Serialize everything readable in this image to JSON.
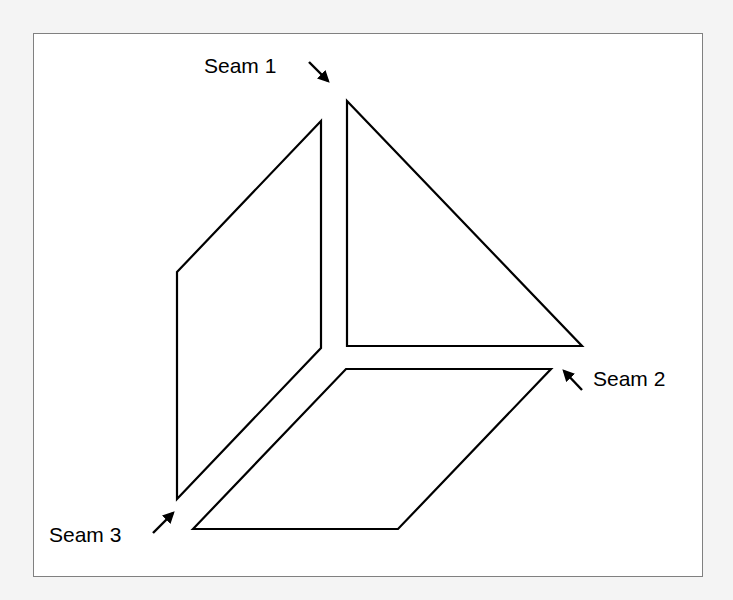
{
  "diagram": {
    "colors": {
      "background": "#f4f4f4",
      "frame_fill": "#ffffff",
      "frame_stroke": "#808080",
      "lines": "#000000"
    },
    "panels": [
      {
        "name": "left-panel",
        "points": "177,272 321,121 321,348 177,499"
      },
      {
        "name": "top-right-panel",
        "points": "347,101 347,346 582,346"
      },
      {
        "name": "bottom-panel",
        "points": "193,529 346,369 551,369 398,529"
      }
    ],
    "labels": [
      {
        "id": "seam1",
        "text": "Seam 1",
        "x": 204,
        "y": 55
      },
      {
        "id": "seam2",
        "text": "Seam 2",
        "x": 593,
        "y": 368
      },
      {
        "id": "seam3",
        "text": "Seam 3",
        "x": 49,
        "y": 524
      }
    ],
    "arrows": [
      {
        "name": "seam-1-arrow",
        "x1": 309,
        "y1": 62,
        "x2": 328,
        "y2": 81
      },
      {
        "name": "seam-2-arrow",
        "x1": 582,
        "y1": 390,
        "x2": 564,
        "y2": 371
      },
      {
        "name": "seam-3-arrow",
        "x1": 153,
        "y1": 533,
        "x2": 173,
        "y2": 513
      }
    ]
  }
}
